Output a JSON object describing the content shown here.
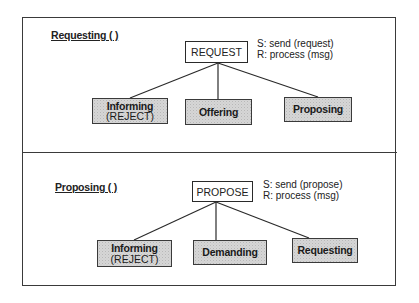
{
  "panels": [
    {
      "heading": "Requesting ( )",
      "root": {
        "label": "REQUEST"
      },
      "note": {
        "line1": "S: send (request)",
        "line2": "R: process (msg)"
      },
      "children": [
        {
          "label": "Informing",
          "sublabel": "(REJECT)"
        },
        {
          "label": "Offering",
          "sublabel": ""
        },
        {
          "label": "Proposing",
          "sublabel": ""
        }
      ]
    },
    {
      "heading": "Proposing ( )",
      "root": {
        "label": "PROPOSE"
      },
      "note": {
        "line1": "S: send (propose)",
        "line2": "R: process (msg)"
      },
      "children": [
        {
          "label": "Informing",
          "sublabel": "(REJECT)"
        },
        {
          "label": "Demanding",
          "sublabel": ""
        },
        {
          "label": "Requesting",
          "sublabel": ""
        }
      ]
    }
  ],
  "colors": {
    "line": "#2a2a2a",
    "child_fill": "#d6d6d6",
    "root_fill": "#ffffff"
  }
}
